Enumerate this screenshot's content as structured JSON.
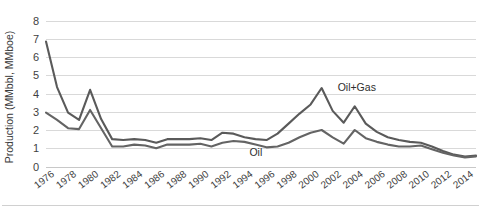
{
  "chart_data": {
    "type": "line",
    "title": "",
    "xlabel": "",
    "ylabel": "Production (MMbbl, MMboe)",
    "ylim": [
      0,
      8
    ],
    "xlim": [
      1976,
      2015
    ],
    "grid": true,
    "legend_position": "inline-annotation",
    "y_ticks": [
      "0",
      "1",
      "2",
      "3",
      "4",
      "5",
      "6",
      "7",
      "8"
    ],
    "x_ticks": [
      "1976",
      "1978",
      "1980",
      "1982",
      "1984",
      "1986",
      "1988",
      "1990",
      "1992",
      "1994",
      "1996",
      "1998",
      "2000",
      "2002",
      "2004",
      "2006",
      "2008",
      "2010",
      "2012",
      "2014"
    ],
    "x": [
      1976,
      1977,
      1978,
      1979,
      1980,
      1981,
      1982,
      1983,
      1984,
      1985,
      1986,
      1987,
      1988,
      1989,
      1990,
      1991,
      1992,
      1993,
      1994,
      1995,
      1996,
      1997,
      1998,
      1999,
      2000,
      2001,
      2002,
      2003,
      2004,
      2005,
      2006,
      2007,
      2008,
      2009,
      2010,
      2011,
      2012,
      2013,
      2014,
      2015
    ],
    "series": [
      {
        "name": "Oil+Gas",
        "color": "#5a5a5a",
        "annotation": "Oil+Gas",
        "annotation_x": 2002,
        "annotation_y": 4.35,
        "values": [
          6.85,
          4.35,
          2.95,
          2.55,
          4.2,
          2.6,
          1.5,
          1.45,
          1.5,
          1.45,
          1.3,
          1.5,
          1.5,
          1.5,
          1.55,
          1.45,
          1.85,
          1.8,
          1.6,
          1.5,
          1.45,
          1.8,
          2.35,
          2.9,
          3.4,
          4.3,
          3.05,
          2.4,
          3.3,
          2.35,
          1.9,
          1.6,
          1.45,
          1.35,
          1.3,
          1.1,
          0.85,
          0.65,
          0.55,
          0.6
        ]
      },
      {
        "name": "Oil",
        "color": "#646464",
        "annotation": "Oil",
        "annotation_x": 1994,
        "annotation_y": 0.8,
        "values": [
          2.95,
          2.55,
          2.1,
          2.05,
          3.1,
          2.1,
          1.1,
          1.1,
          1.2,
          1.15,
          1.0,
          1.2,
          1.2,
          1.2,
          1.25,
          1.1,
          1.3,
          1.4,
          1.35,
          1.2,
          1.05,
          1.1,
          1.3,
          1.6,
          1.85,
          2.0,
          1.6,
          1.25,
          2.0,
          1.55,
          1.35,
          1.2,
          1.1,
          1.1,
          1.15,
          0.95,
          0.75,
          0.6,
          0.5,
          0.55
        ]
      }
    ]
  },
  "axes": {
    "y_title": "Production (MMbbl, MMboe)"
  }
}
